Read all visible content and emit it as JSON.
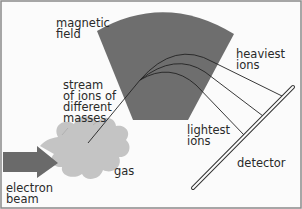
{
  "diagram": {
    "labels": {
      "magnetic_field": "magnetic\nfield",
      "heaviest_ions": "heaviest\nions",
      "stream": "stream\nof ions of\ndifferent\nmasses",
      "lightest_ions": "lightest\nions",
      "gas": "gas",
      "detector": "detector",
      "electron_beam": "electron\nbeam"
    },
    "colors": {
      "background": "#fbfbfb",
      "border": "#8a8a8a",
      "magnetic_field": "#6e6e6e",
      "gas_cloud": "#c4c4c4",
      "arrow": "#6a6a6a",
      "lines": "#222222"
    }
  }
}
